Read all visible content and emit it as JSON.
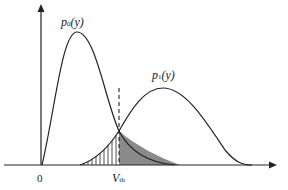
{
  "labels": {
    "p0": "p",
    "p0_sub": "0",
    "p0_arg": "(y)",
    "p1": "p",
    "p1_sub": "1",
    "p1_arg": "(y)",
    "origin": "0",
    "vth": "V",
    "vth_sub": "th"
  },
  "colors": {
    "line": "#222222",
    "shade": "#8a8a8a"
  }
}
